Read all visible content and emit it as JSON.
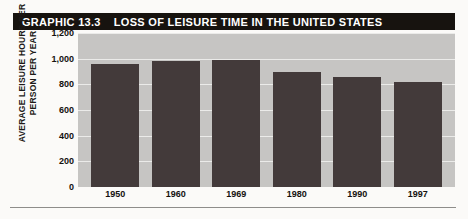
{
  "header": {
    "graphic_number": "GRAPHIC 13.3",
    "title": "LOSS OF LEISURE TIME IN THE UNITED STATES",
    "bar_color": "#17130f",
    "text_color": "#ffffff"
  },
  "colors": {
    "plot_background": "#c6c5c3",
    "bar_fill": "#433a3a",
    "gridline": "#ebebe9",
    "page_background": "#fbfaf8",
    "rule": "#8e8d8a"
  },
  "chart_data": {
    "type": "bar",
    "title": "LOSS OF LEISURE TIME IN THE UNITED STATES",
    "xlabel": "",
    "ylabel": "AVERAGE LEISURE HOURS PER PERSON PER YEAR",
    "ylabel_lines": [
      "AVERAGE LEISURE HOURS PER",
      "PERSON PER YEAR"
    ],
    "categories": [
      "1950",
      "1960",
      "1969",
      "1980",
      "1990",
      "1997"
    ],
    "values": [
      960,
      985,
      990,
      895,
      855,
      815
    ],
    "ylim": [
      0,
      1200
    ],
    "yticks": [
      1200,
      1000,
      800,
      600,
      400,
      200,
      0
    ],
    "ytick_labels": [
      "1,200",
      "1,000",
      "800",
      "600",
      "400",
      "200",
      "0"
    ],
    "grid": true,
    "legend": false
  }
}
